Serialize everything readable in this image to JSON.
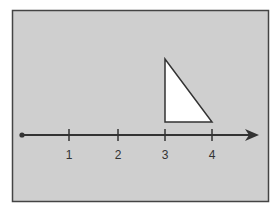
{
  "diagram": {
    "type": "number-line-with-triangle",
    "colors": {
      "background": "#cfcfcf",
      "frame": "#444444",
      "line": "#333333",
      "triangle_fill": "#ffffff"
    },
    "number_line": {
      "start_point": "origin dot",
      "ticks": [
        {
          "value": 1,
          "label": "1"
        },
        {
          "value": 2,
          "label": "2"
        },
        {
          "value": 3,
          "label": "3"
        },
        {
          "value": 4,
          "label": "4"
        }
      ],
      "arrow": "right"
    },
    "triangle": {
      "shape": "right triangle",
      "base_from": 3,
      "base_to": 4,
      "right_angle_at": 3
    }
  }
}
